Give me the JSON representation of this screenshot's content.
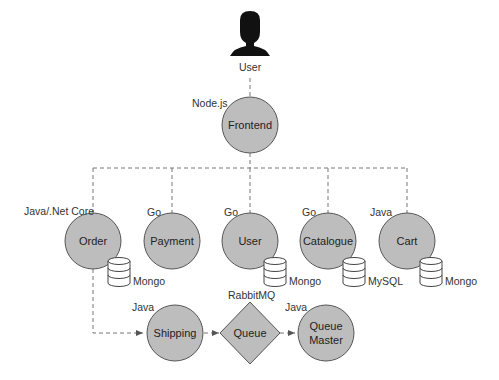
{
  "colors": {
    "node_fill": "#bdbdbd",
    "node_stroke": "#555555",
    "line": "#777777",
    "db_fill": "#ffffff",
    "db_stroke": "#444444",
    "user_icon": "#111111"
  },
  "user": {
    "label": "User",
    "icon": "user-silhouette-icon"
  },
  "frontend": {
    "name": "Frontend",
    "tech": "Node.js"
  },
  "services": [
    {
      "name": "Order",
      "tech": "Java/.Net Core",
      "db": "Mongo"
    },
    {
      "name": "Payment",
      "tech": "Go",
      "db": null
    },
    {
      "name": "User",
      "tech": "Go",
      "db": "Mongo"
    },
    {
      "name": "Catalogue",
      "tech": "Go",
      "db": "MySQL"
    },
    {
      "name": "Cart",
      "tech": "Java",
      "db": "Mongo"
    }
  ],
  "pipeline": {
    "shipping": {
      "name": "Shipping",
      "tech": "Java"
    },
    "queue": {
      "name": "Queue",
      "tech": "RabbitMQ"
    },
    "queue_master": {
      "name_line1": "Queue",
      "name_line2": "Master",
      "tech": "Java"
    }
  }
}
